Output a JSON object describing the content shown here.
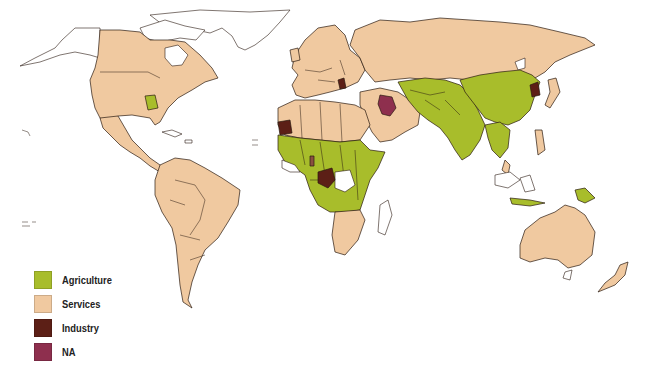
{
  "map": {
    "type": "choropleth-world-map",
    "colors": {
      "agriculture": "#a8bd2b",
      "services": "#f0c9a0",
      "industry": "#5c1f16",
      "na": "#8e2f4e",
      "no_data": "#ffffff",
      "border": "#2a1a10"
    },
    "regions": {
      "north_america": "services",
      "georgia_us": "agriculture",
      "central_america": "services",
      "south_america": "services",
      "greenland": "no_data",
      "europe": "services",
      "serbia": "industry",
      "russia": "services",
      "middle_east": "services",
      "iraq": "na",
      "north_africa": "services",
      "western_sahara": "industry",
      "sub_saharan_africa": "agriculture",
      "gabon_congo": "industry",
      "southern_africa": "services",
      "central_asia": "agriculture",
      "south_asia": "agriculture",
      "china": "agriculture",
      "north_korea": "industry",
      "southeast_asia": "agriculture",
      "papua_new_guinea": "agriculture",
      "australia": "services",
      "new_zealand": "services"
    }
  },
  "legend": {
    "items": [
      {
        "key": "agriculture",
        "label": "Agriculture",
        "color": "#a8bd2b"
      },
      {
        "key": "services",
        "label": "Services",
        "color": "#f0c9a0"
      },
      {
        "key": "industry",
        "label": "Industry",
        "color": "#5c1f16"
      },
      {
        "key": "na",
        "label": "NA",
        "color": "#8e2f4e"
      }
    ]
  }
}
